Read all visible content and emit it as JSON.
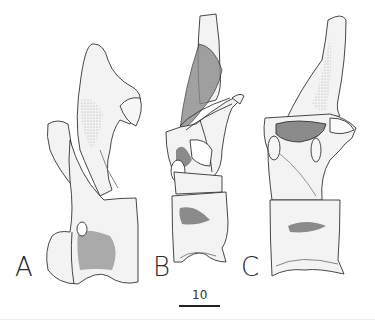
{
  "figure": {
    "panels": [
      {
        "label": "A",
        "view": "lateral vertebra"
      },
      {
        "label": "B",
        "view": "anterior/oblique vertebra"
      },
      {
        "label": "C",
        "view": "lateral vertebra"
      }
    ],
    "scale_bar": {
      "label": "10"
    },
    "colors": {
      "outline": "#333333",
      "bone_fill": "#f3f3f3",
      "shade_dark": "#7a7a7a",
      "shade_mid": "#b5b5b5",
      "background": "#ffffff"
    }
  }
}
